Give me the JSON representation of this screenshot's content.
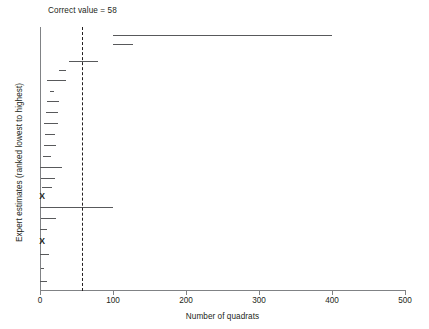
{
  "chart_data": {
    "type": "bar",
    "orientation": "horizontal",
    "title": "Correct value = 58",
    "xlabel": "Number of quadrats",
    "ylabel": "Expert estimates (ranked lowest to highest)",
    "xlim": [
      0,
      500
    ],
    "xticks": [
      0,
      100,
      200,
      300,
      400,
      500
    ],
    "xtick_labels": [
      "0",
      "100",
      "200",
      "300",
      "400",
      "500"
    ],
    "grid": false,
    "legend": null,
    "reference_line": {
      "name": "correct-value-line",
      "value": 58,
      "style": "dashed",
      "label": "Correct value = 58"
    },
    "series": [
      {
        "name": "expert-interval-estimates",
        "note": "rank 1 = bottom of plot, rank 24 = top of plot",
        "intervals": [
          {
            "rank": 1,
            "low": 0,
            "high": 10
          },
          {
            "rank": 2,
            "low": 2,
            "high": 6
          },
          {
            "rank": 3,
            "low": 0,
            "high": 12
          },
          {
            "rank": 4,
            "low": 0,
            "high": 0,
            "marker": "X"
          },
          {
            "rank": 5,
            "low": 0,
            "high": 9
          },
          {
            "rank": 6,
            "low": 2,
            "high": 22
          },
          {
            "rank": 7,
            "low": 0,
            "high": 100
          },
          {
            "rank": 8,
            "low": 0,
            "high": 0,
            "marker": "X"
          },
          {
            "rank": 9,
            "low": 3,
            "high": 16
          },
          {
            "rank": 10,
            "low": 2,
            "high": 20
          },
          {
            "rank": 11,
            "low": 0,
            "high": 30
          },
          {
            "rank": 12,
            "low": 4,
            "high": 15
          },
          {
            "rank": 13,
            "low": 5,
            "high": 22
          },
          {
            "rank": 14,
            "low": 7,
            "high": 21
          },
          {
            "rank": 15,
            "low": 5,
            "high": 24
          },
          {
            "rank": 16,
            "low": 8,
            "high": 24
          },
          {
            "rank": 17,
            "low": 10,
            "high": 26
          },
          {
            "rank": 18,
            "low": 14,
            "high": 19
          },
          {
            "rank": 19,
            "low": 10,
            "high": 36
          },
          {
            "rank": 20,
            "low": 26,
            "high": 36
          },
          {
            "rank": 21,
            "low": 40,
            "high": 80
          },
          {
            "rank": 22,
            "low": 100,
            "high": 128
          },
          {
            "rank": 23,
            "low": 100,
            "high": 400
          }
        ]
      }
    ]
  },
  "axes": {
    "x_min": 0,
    "x_max": 500
  },
  "bars": [
    {
      "name": "interval-rank-23",
      "low": 100,
      "high": 400,
      "y": 35
    },
    {
      "name": "interval-rank-22",
      "low": 100,
      "high": 128,
      "y": 44
    },
    {
      "name": "interval-rank-21",
      "low": 40,
      "high": 80,
      "y": 61
    },
    {
      "name": "interval-rank-20",
      "low": 26,
      "high": 36,
      "y": 70
    },
    {
      "name": "interval-rank-19",
      "low": 10,
      "high": 36,
      "y": 80
    },
    {
      "name": "interval-rank-18",
      "low": 14,
      "high": 19,
      "y": 91
    },
    {
      "name": "interval-rank-17",
      "low": 10,
      "high": 26,
      "y": 101
    },
    {
      "name": "interval-rank-16",
      "low": 8,
      "high": 24,
      "y": 112
    },
    {
      "name": "interval-rank-15",
      "low": 5,
      "high": 24,
      "y": 123
    },
    {
      "name": "interval-rank-14",
      "low": 7,
      "high": 21,
      "y": 134
    },
    {
      "name": "interval-rank-13",
      "low": 5,
      "high": 22,
      "y": 145
    },
    {
      "name": "interval-rank-12",
      "low": 4,
      "high": 15,
      "y": 156
    },
    {
      "name": "interval-rank-11",
      "low": 0,
      "high": 30,
      "y": 167
    },
    {
      "name": "interval-rank-10",
      "low": 2,
      "high": 20,
      "y": 178
    },
    {
      "name": "interval-rank-9",
      "low": 3,
      "high": 16,
      "y": 187
    },
    {
      "name": "interval-rank-7",
      "low": 0,
      "high": 100,
      "y": 207
    },
    {
      "name": "interval-rank-6",
      "low": 2,
      "high": 22,
      "y": 218
    },
    {
      "name": "interval-rank-5",
      "low": 0,
      "high": 9,
      "y": 229
    },
    {
      "name": "interval-rank-3",
      "low": 0,
      "high": 12,
      "y": 254
    },
    {
      "name": "interval-rank-2",
      "low": 2,
      "high": 6,
      "y": 268
    },
    {
      "name": "interval-rank-1",
      "low": 0,
      "high": 10,
      "y": 281
    }
  ],
  "markers": [
    {
      "name": "x-marker-rank-4",
      "label": "X",
      "value": 3,
      "y": 196
    },
    {
      "name": "x-marker-rank-8",
      "label": "X",
      "value": 3,
      "y": 241
    }
  ]
}
